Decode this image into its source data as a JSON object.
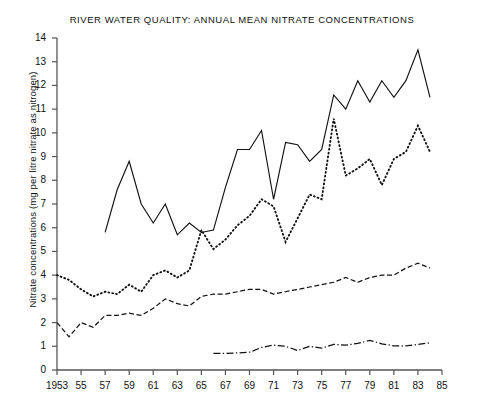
{
  "chart_data": {
    "type": "line",
    "title": "RIVER WATER QUALITY: ANNUAL MEAN NITRATE CONCENTRATIONS",
    "xlabel": "",
    "ylabel": "Nitrate concentrations (mg per litre nitrate as nitrogen)",
    "xlim": [
      1953,
      1985
    ],
    "ylim": [
      0,
      14
    ],
    "grid": false,
    "legend": "none",
    "yticks": [
      0,
      1,
      2,
      3,
      4,
      5,
      6,
      7,
      8,
      9,
      10,
      11,
      12,
      13,
      14
    ],
    "ytick_labels": [
      "0",
      "1",
      "2",
      "3",
      "4",
      "5",
      "6",
      "7",
      "8",
      "9",
      "10",
      "11",
      "12",
      "13",
      "14"
    ],
    "xticks": [
      1953,
      1955,
      1957,
      1959,
      1961,
      1963,
      1965,
      1967,
      1969,
      1971,
      1973,
      1975,
      1977,
      1979,
      1981,
      1983,
      1985
    ],
    "xtick_labels": [
      "1953",
      "55",
      "57",
      "59",
      "61",
      "63",
      "65",
      "67",
      "69",
      "71",
      "73",
      "75",
      "77",
      "79",
      "81",
      "83",
      "85"
    ],
    "series": [
      {
        "name": "upper-solid-series",
        "style": "solid",
        "color": "#111111",
        "x": [
          1957,
          1958,
          1959,
          1960,
          1961,
          1962,
          1963,
          1964,
          1965,
          1966,
          1967,
          1968,
          1969,
          1970,
          1971,
          1972,
          1973,
          1974,
          1975,
          1976,
          1977,
          1978,
          1979,
          1980,
          1981,
          1982,
          1983,
          1984
        ],
        "values": [
          5.8,
          7.6,
          8.8,
          7.0,
          6.2,
          7.0,
          5.7,
          6.2,
          5.8,
          5.9,
          7.7,
          9.3,
          9.3,
          10.1,
          7.2,
          9.6,
          9.5,
          8.8,
          9.3,
          11.6,
          11.0,
          12.2,
          11.3,
          12.2,
          11.5,
          12.2,
          13.5,
          11.5
        ]
      },
      {
        "name": "middle-dotted-series",
        "style": "dotted",
        "color": "#111111",
        "x": [
          1953,
          1954,
          1955,
          1956,
          1957,
          1958,
          1959,
          1960,
          1961,
          1962,
          1963,
          1964,
          1965,
          1966,
          1967,
          1968,
          1969,
          1970,
          1971,
          1972,
          1973,
          1974,
          1975,
          1976,
          1977,
          1978,
          1979,
          1980,
          1981,
          1982,
          1983,
          1984
        ],
        "values": [
          4.0,
          3.8,
          3.4,
          3.1,
          3.3,
          3.2,
          3.6,
          3.3,
          4.0,
          4.2,
          3.9,
          4.2,
          5.9,
          5.1,
          5.5,
          6.1,
          6.5,
          7.2,
          6.9,
          5.4,
          6.4,
          7.4,
          7.2,
          10.6,
          8.2,
          8.5,
          8.9,
          7.8,
          8.9,
          9.2,
          10.3,
          9.2
        ]
      },
      {
        "name": "lower-dashed-series",
        "style": "dashed",
        "color": "#111111",
        "x": [
          1953,
          1954,
          1955,
          1956,
          1957,
          1958,
          1959,
          1960,
          1961,
          1962,
          1963,
          1964,
          1965,
          1966,
          1967,
          1968,
          1969,
          1970,
          1971,
          1972,
          1973,
          1974,
          1975,
          1976,
          1977,
          1978,
          1979,
          1980,
          1981,
          1982,
          1983,
          1984
        ],
        "values": [
          2.0,
          1.4,
          2.0,
          1.8,
          2.3,
          2.3,
          2.4,
          2.3,
          2.6,
          3.0,
          2.8,
          2.7,
          3.1,
          3.2,
          3.2,
          3.3,
          3.4,
          3.4,
          3.2,
          3.3,
          3.4,
          3.5,
          3.6,
          3.7,
          3.9,
          3.7,
          3.9,
          4.0,
          4.0,
          4.3,
          4.5,
          4.3
        ]
      },
      {
        "name": "bottom-dashdot-series",
        "style": "dashdot",
        "color": "#111111",
        "x": [
          1966,
          1967,
          1968,
          1969,
          1970,
          1971,
          1972,
          1973,
          1974,
          1975,
          1976,
          1977,
          1978,
          1979,
          1980,
          1981,
          1982,
          1983,
          1984
        ],
        "values": [
          0.7,
          0.7,
          0.72,
          0.75,
          0.95,
          1.05,
          1.0,
          0.82,
          1.0,
          0.92,
          1.08,
          1.05,
          1.12,
          1.25,
          1.1,
          1.02,
          1.02,
          1.08,
          1.15
        ]
      }
    ]
  }
}
